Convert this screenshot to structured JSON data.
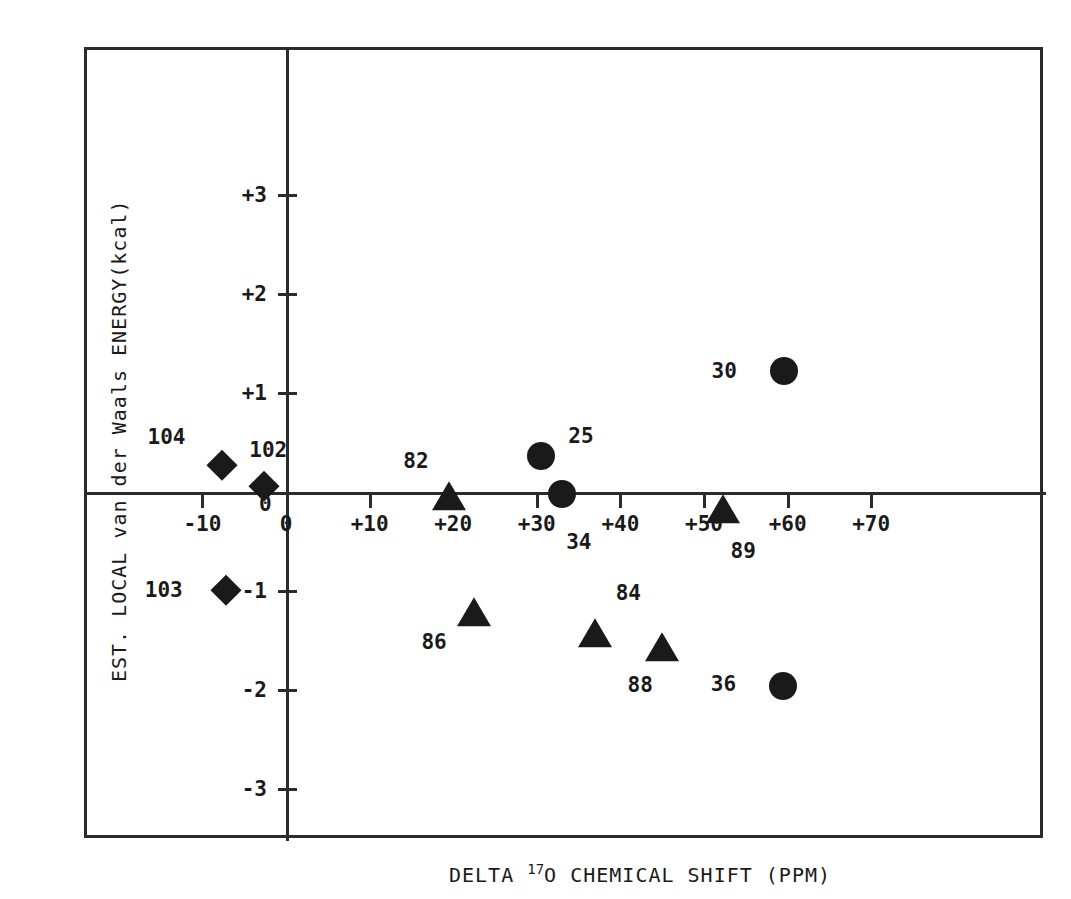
{
  "chart_data": {
    "type": "scatter",
    "title": "",
    "xlabel": "DELTA 17O CHEMICAL SHIFT (PPM)",
    "xlabel_prefix": "DELTA ",
    "xlabel_sup": "17",
    "xlabel_suffix": "O CHEMICAL SHIFT (PPM)",
    "ylabel": "EST. LOCAL van der Waals ENERGY(kcal)",
    "xlim": [
      -17,
      75
    ],
    "ylim": [
      -3.8,
      3.6
    ],
    "grid": false,
    "legend": "none",
    "xticks": [
      {
        "value": -10,
        "label": "-10"
      },
      {
        "value": 0,
        "label": "0"
      },
      {
        "value": 10,
        "label": "+10"
      },
      {
        "value": 20,
        "label": "+20"
      },
      {
        "value": 30,
        "label": "+30"
      },
      {
        "value": 40,
        "label": "+40"
      },
      {
        "value": 50,
        "label": "+50"
      },
      {
        "value": 60,
        "label": "+60"
      },
      {
        "value": 70,
        "label": "+70"
      }
    ],
    "yticks": [
      {
        "value": 3,
        "label": "+3"
      },
      {
        "value": 2,
        "label": "+2"
      },
      {
        "value": 1,
        "label": "+1"
      },
      {
        "value": 0,
        "label": "0"
      },
      {
        "value": -1,
        "label": "-1"
      },
      {
        "value": -2,
        "label": "-2"
      },
      {
        "value": -3,
        "label": "-3"
      }
    ],
    "marker_shapes": [
      "circle",
      "triangle",
      "diamond"
    ],
    "points": [
      {
        "label": "104",
        "shape": "diamond",
        "x": -7.6,
        "y": 0.27,
        "label_dx": -56,
        "label_dy": -28
      },
      {
        "label": "102",
        "shape": "diamond",
        "x": -2.6,
        "y": 0.06,
        "label_dx": 4,
        "label_dy": -36
      },
      {
        "label": "103",
        "shape": "diamond",
        "x": -7.2,
        "y": -0.99,
        "label_dx": -62,
        "label_dy": 0
      },
      {
        "label": "82",
        "shape": "triangle",
        "x": 19.5,
        "y": -0.02,
        "label_dx": -33,
        "label_dy": -33
      },
      {
        "label": "25",
        "shape": "circle",
        "x": 30.5,
        "y": 0.36,
        "label_dx": 40,
        "label_dy": -20
      },
      {
        "label": "34",
        "shape": "circle",
        "x": 33.0,
        "y": -0.02,
        "label_dx": 17,
        "label_dy": 48
      },
      {
        "label": "30",
        "shape": "circle",
        "x": 59.6,
        "y": 1.22,
        "label_dx": -60,
        "label_dy": 0
      },
      {
        "label": "89",
        "shape": "triangle",
        "x": 52.3,
        "y": -0.15,
        "label_dx": 20,
        "label_dy": 44
      },
      {
        "label": "86",
        "shape": "triangle",
        "x": 22.5,
        "y": -1.19,
        "label_dx": -40,
        "label_dy": 32
      },
      {
        "label": "84",
        "shape": "triangle",
        "x": 37.0,
        "y": -1.4,
        "label_dx": 33,
        "label_dy": -38
      },
      {
        "label": "88",
        "shape": "triangle",
        "x": 45.0,
        "y": -1.55,
        "label_dx": -22,
        "label_dy": 40
      },
      {
        "label": "36",
        "shape": "circle",
        "x": 59.5,
        "y": -1.96,
        "label_dx": -60,
        "label_dy": -2
      }
    ],
    "colors": {
      "marker": "#1a1a1a",
      "axis": "#2b2b2b",
      "background": "#ffffff",
      "text": "#1a1a1a"
    }
  }
}
